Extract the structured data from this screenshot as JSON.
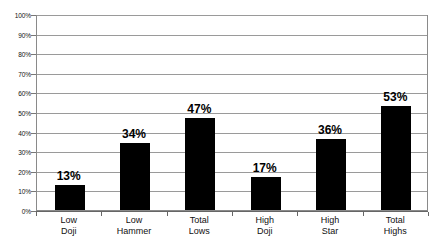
{
  "chart_data": {
    "type": "bar",
    "title": "",
    "xlabel": "",
    "ylabel": "",
    "ylim": [
      0,
      100
    ],
    "grid": true,
    "legend": "none",
    "orientation": "vertical",
    "bar_color": "#000000",
    "gridline_color": "#9a9a9a",
    "border_color": "#8a8a8a",
    "categories": [
      "Low Doji",
      "Low Hammer",
      "Total Lows",
      "High Doji",
      "High Star",
      "Total Highs"
    ],
    "category_lines": [
      [
        "Low",
        "Doji"
      ],
      [
        "Low",
        "Hammer"
      ],
      [
        "Total",
        "Lows"
      ],
      [
        "High",
        "Doji"
      ],
      [
        "High",
        "Star"
      ],
      [
        "Total",
        "Highs"
      ]
    ],
    "values": [
      13,
      34,
      47,
      17,
      36,
      53
    ],
    "value_labels": [
      "13%",
      "34%",
      "47%",
      "17%",
      "36%",
      "53%"
    ],
    "yticks": [
      0,
      10,
      20,
      30,
      40,
      50,
      60,
      70,
      80,
      90,
      100
    ],
    "ytick_labels": [
      "0%",
      "10%",
      "20%",
      "30%",
      "40%",
      "50%",
      "60%",
      "70%",
      "80%",
      "90%",
      "100%"
    ]
  }
}
